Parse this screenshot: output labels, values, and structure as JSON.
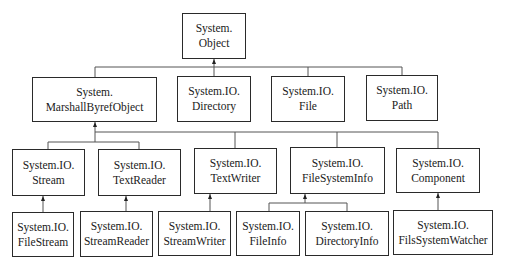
{
  "diagram": {
    "type": "class-hierarchy",
    "nodes": {
      "object": {
        "line1": "System.",
        "line2": "Object"
      },
      "marshal": {
        "line1": "System.",
        "line2": "MarshallByrefObject"
      },
      "directory": {
        "line1": "System.IO.",
        "line2": "Directory"
      },
      "file": {
        "line1": "System.IO.",
        "line2": "File"
      },
      "path": {
        "line1": "System.IO.",
        "line2": "Path"
      },
      "stream": {
        "line1": "System.IO.",
        "line2": "Stream"
      },
      "textreader": {
        "line1": "System.IO.",
        "line2": "TextReader"
      },
      "textwriter": {
        "line1": "System.IO.",
        "line2": "TextWriter"
      },
      "filesysteminfo": {
        "line1": "System.IO.",
        "line2": "FileSystemInfo"
      },
      "component": {
        "line1": "System.IO.",
        "line2": "Component"
      },
      "filestream": {
        "line1": "System.IO.",
        "line2": "FileStream"
      },
      "streamreader": {
        "line1": "System.IO.",
        "line2": "StreamReader"
      },
      "streamwriter": {
        "line1": "System.IO.",
        "line2": "StreamWriter"
      },
      "fileinfo": {
        "line1": "System.IO.",
        "line2": "FileInfo"
      },
      "directoryinfo": {
        "line1": "System.IO.",
        "line2": "DirectoryInfo"
      },
      "filssystemwatcher": {
        "line1": "System.IO.",
        "line2": "FilsSystemWatcher"
      }
    },
    "edges": [
      [
        "marshal",
        "object"
      ],
      [
        "directory",
        "object"
      ],
      [
        "file",
        "object"
      ],
      [
        "path",
        "object"
      ],
      [
        "stream",
        "marshal"
      ],
      [
        "textreader",
        "marshal"
      ],
      [
        "textwriter",
        "marshal"
      ],
      [
        "filesysteminfo",
        "marshal"
      ],
      [
        "component",
        "marshal"
      ],
      [
        "filestream",
        "stream"
      ],
      [
        "streamreader",
        "textreader"
      ],
      [
        "streamwriter",
        "textwriter"
      ],
      [
        "fileinfo",
        "filesysteminfo"
      ],
      [
        "directoryinfo",
        "filesysteminfo"
      ],
      [
        "filssystemwatcher",
        "component"
      ]
    ],
    "colors": {
      "line": "#2a2a2a",
      "connector": "#555555",
      "background": "#ffffff"
    }
  }
}
